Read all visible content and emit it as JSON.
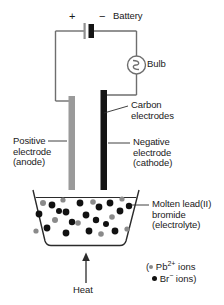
{
  "diagram": {
    "signs": {
      "positive": "+",
      "negative": "−"
    },
    "labels": {
      "battery": "Battery",
      "bulb": "Bulb",
      "carbon_electrodes": "Carbon\nelectrodes",
      "positive_electrode": "Positive\nelectrode\n(anode)",
      "negative_electrode": "Negative\nelectrode\n(cathode)",
      "electrolyte": "Molten lead(II)\nbromide\n(electrolyte)",
      "heat": "Heat"
    },
    "legend": {
      "open_paren": "(",
      "pb_text": " Pb",
      "pb_charge": "2+",
      "pb_tail": " ions",
      "br_text": " Br",
      "br_charge": "−",
      "br_tail": " ions)"
    },
    "colors": {
      "wire": "#6e6e6e",
      "anode": "#9a9a9a",
      "cathode": "#141414",
      "beaker": "#2b2b2b",
      "pb_ion": "#8a8a8a",
      "br_ion": "#111111",
      "text": "#1a1a1a",
      "background": "#ffffff"
    },
    "ions": {
      "pb": [
        {
          "x": 43,
          "y": 203,
          "r": 3.0
        },
        {
          "x": 63,
          "y": 200,
          "r": 2.6
        },
        {
          "x": 93,
          "y": 202,
          "r": 2.8
        },
        {
          "x": 55,
          "y": 220,
          "r": 3.0
        },
        {
          "x": 78,
          "y": 223,
          "r": 2.8
        },
        {
          "x": 112,
          "y": 217,
          "r": 2.8
        },
        {
          "x": 122,
          "y": 199,
          "r": 2.6
        },
        {
          "x": 36,
          "y": 231,
          "r": 2.6
        },
        {
          "x": 101,
          "y": 234,
          "r": 2.8
        },
        {
          "x": 127,
          "y": 229,
          "r": 2.6
        }
      ],
      "br": [
        {
          "x": 39,
          "y": 214,
          "r": 3.4
        },
        {
          "x": 52,
          "y": 205,
          "r": 3.4
        },
        {
          "x": 66,
          "y": 212,
          "r": 3.4
        },
        {
          "x": 80,
          "y": 203,
          "r": 3.4
        },
        {
          "x": 86,
          "y": 215,
          "r": 3.4
        },
        {
          "x": 99,
          "y": 207,
          "r": 3.4
        },
        {
          "x": 110,
          "y": 203,
          "r": 3.4
        },
        {
          "x": 120,
          "y": 211,
          "r": 3.4
        },
        {
          "x": 129,
          "y": 206,
          "r": 3.2
        },
        {
          "x": 47,
          "y": 228,
          "r": 3.4
        },
        {
          "x": 66,
          "y": 233,
          "r": 3.4
        },
        {
          "x": 72,
          "y": 222,
          "r": 3.2
        },
        {
          "x": 89,
          "y": 231,
          "r": 3.4
        },
        {
          "x": 96,
          "y": 220,
          "r": 3.2
        },
        {
          "x": 115,
          "y": 231,
          "r": 3.4
        },
        {
          "x": 59,
          "y": 211,
          "r": 3.0
        },
        {
          "x": 106,
          "y": 224,
          "r": 3.0
        }
      ]
    }
  }
}
